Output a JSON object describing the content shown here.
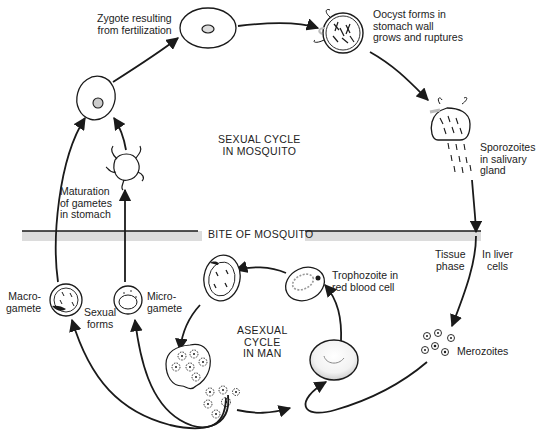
{
  "diagram": {
    "title_regions": {
      "sexual_cycle": "SEXUAL CYCLE\nIN MOSQUITO",
      "asexual_cycle": "ASEXUAL\nCYCLE\nIN MAN",
      "divider": "BITE OF MOSQUITO"
    },
    "labels": {
      "zygote": "Zygote resulting\nfrom fertilization",
      "oocyst": "Oocyst forms in\nstomach wall\ngrows and ruptures",
      "sporozoites": "Sporozoites\nin salivary\ngland",
      "maturation": "Maturation\nof gametes\nin stomach",
      "tissue_phase": "Tissue\nphase",
      "liver_cells": "In liver\ncells",
      "macrogamete": "Macro-\ngamete",
      "sexual_forms": "Sexual\nforms",
      "microgamete": "Micro-\ngamete",
      "trophozoite": "Trophozoite in\nred blood cell",
      "merozoites": "Merozoites"
    },
    "colors": {
      "line": "#1a1a1a",
      "band": "#dcdcdc",
      "shade": "#bdbdbd"
    }
  }
}
